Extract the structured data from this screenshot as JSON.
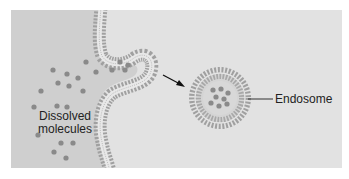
{
  "diagram": {
    "labels": {
      "dissolved_line1": "Dissolved",
      "dissolved_line2": "molecules",
      "endosome": "Endosome"
    },
    "colors": {
      "page_background": "#ffffff",
      "extracellular": "#cfcfcf",
      "intracellular": "#e2e2e2",
      "molecule": "#8a8a8a",
      "lipid_head": "#9a9a9a",
      "leader_line": "#333333"
    }
  }
}
